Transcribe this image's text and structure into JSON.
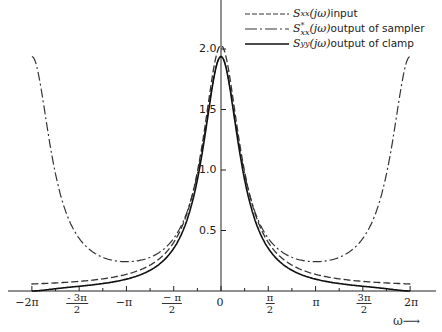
{
  "chart_data": {
    "type": "line",
    "title": "",
    "xlabel": "ω",
    "ylabel": "",
    "xlim": [
      -6.5,
      6.7
    ],
    "ylim": [
      0,
      2.2
    ],
    "grid": false,
    "legend_position": "top-right",
    "x_ticks": [
      "-2π",
      "-3π/2",
      "-π",
      "-π/2",
      "0",
      "π/2",
      "π",
      "3π/2",
      "2π"
    ],
    "y_ticks": [
      "0.5",
      "1.0",
      "1.5",
      "2.0"
    ],
    "x": [
      -6.283,
      -5.498,
      -4.712,
      -3.927,
      -3.142,
      -2.356,
      -1.571,
      -0.785,
      0,
      0.785,
      1.571,
      2.356,
      3.142,
      3.927,
      4.712,
      5.498,
      6.283
    ],
    "series": [
      {
        "name": "Sxx(jω) input",
        "style": "dashed",
        "values": [
          0.05,
          0.06,
          0.09,
          0.12,
          0.18,
          0.28,
          0.5,
          1.05,
          2.0,
          1.05,
          0.5,
          0.28,
          0.18,
          0.12,
          0.09,
          0.06,
          0.05
        ]
      },
      {
        "name": "S*xx(jω) output of sampler",
        "style": "dash-dot",
        "values": [
          2.14,
          1.1,
          0.68,
          0.52,
          0.47,
          0.52,
          0.68,
          1.1,
          2.14,
          1.1,
          0.68,
          0.52,
          0.47,
          0.52,
          0.68,
          1.1,
          2.14
        ]
      },
      {
        "name": "Syy(jω) output of clamp",
        "style": "solid",
        "values": [
          0.01,
          0.03,
          0.06,
          0.1,
          0.17,
          0.29,
          0.55,
          1.15,
          2.14,
          1.15,
          0.55,
          0.29,
          0.17,
          0.1,
          0.06,
          0.03,
          0.01
        ]
      }
    ]
  },
  "legend": {
    "items": [
      {
        "sym": "S",
        "sub": "xx",
        "sup": "",
        "arg": "(jω)",
        "text": " input"
      },
      {
        "sym": "S",
        "sub": "xx",
        "sup": "*",
        "arg": "(jω)",
        "text": " output of sampler"
      },
      {
        "sym": "S",
        "sub": "yy",
        "sup": "",
        "arg": "(jω)",
        "text": " output of clamp"
      }
    ]
  },
  "axis": {
    "xlabel": "ω⟶",
    "y_ticks": [
      "2.0",
      "1.5",
      "1.0",
      "0.5"
    ],
    "x_simple": {
      "m2pi": "−2π",
      "mpi": "−π",
      "zero": "0",
      "pi": "π",
      "p2pi": "2π"
    },
    "x_frac": {
      "m3pi2": {
        "sign": "-",
        "num": "3π",
        "den": "2"
      },
      "mpi2": {
        "sign": "−",
        "num": "π",
        "den": "2"
      },
      "pi2": {
        "num": "π",
        "den": "2"
      },
      "p3pi2": {
        "num": "3π",
        "den": "2"
      }
    }
  }
}
